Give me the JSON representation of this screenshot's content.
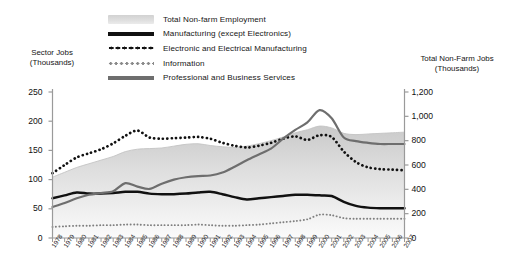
{
  "legend": {
    "items": [
      {
        "label": "Total Non-farm Employment",
        "style": "area-fill",
        "color": "#dcdcdc"
      },
      {
        "label": "Manufacturing (except Electronics)",
        "style": "solid-thick",
        "color": "#111111"
      },
      {
        "label": "Electronic and Electrical Manufacturing",
        "style": "dotted-bold",
        "color": "#111111"
      },
      {
        "label": "Information",
        "style": "dotted-fine",
        "color": "#8a8a8a"
      },
      {
        "label": "Professional and Business Services",
        "style": "solid-medium",
        "color": "#6e6e6e"
      }
    ]
  },
  "axes": {
    "left_title_line1": "Sector Jobs",
    "left_title_line2": "(Thousands)",
    "right_title_line1": "Total Non-Farm Jobs",
    "right_title_line2": "(Thousands)",
    "left_ticks": [
      "250",
      "200",
      "150",
      "100",
      "50",
      "0"
    ],
    "right_ticks": [
      "1,200",
      "1,000",
      "800",
      "600",
      "400",
      "200",
      "0"
    ]
  },
  "chart_data": {
    "type": "line",
    "title": "",
    "xlabel": "",
    "ylabel": "Sector Jobs (Thousands)",
    "y2label": "Total Non-Farm Jobs (Thousands)",
    "ylim": [
      0,
      250
    ],
    "y2lim": [
      0,
      1200
    ],
    "grid": false,
    "legend_position": "top-center",
    "x": [
      "1978",
      "1979",
      "1980",
      "1981",
      "1982",
      "1983",
      "1984",
      "1985",
      "1986",
      "1987",
      "1988",
      "1989",
      "1990",
      "1991",
      "1992",
      "1993",
      "1994",
      "1995",
      "1996",
      "1997",
      "1998",
      "1999",
      "2000",
      "2001",
      "2002",
      "2003",
      "2004",
      "2005",
      "2006",
      "2007"
    ],
    "series": [
      {
        "name": "Total Non-farm Employment",
        "axis": "right",
        "style": "area",
        "values": [
          500,
          540,
          580,
          610,
          640,
          670,
          710,
          730,
          735,
          740,
          755,
          770,
          775,
          760,
          750,
          745,
          755,
          775,
          800,
          830,
          865,
          890,
          920,
          905,
          860,
          850,
          855,
          860,
          865,
          870
        ]
      },
      {
        "name": "Manufacturing (except Electronics)",
        "axis": "left",
        "style": "solid-thick",
        "values": [
          68,
          73,
          78,
          76,
          76,
          77,
          79,
          79,
          76,
          75,
          75,
          76,
          78,
          79,
          75,
          70,
          66,
          68,
          70,
          72,
          74,
          74,
          73,
          72,
          62,
          55,
          52,
          51,
          51,
          51
        ]
      },
      {
        "name": "Electronic and Electrical Manufacturing",
        "axis": "left",
        "style": "dotted-bold",
        "values": [
          111,
          125,
          138,
          145,
          152,
          162,
          175,
          184,
          172,
          170,
          171,
          172,
          173,
          170,
          163,
          158,
          155,
          158,
          163,
          170,
          174,
          168,
          176,
          173,
          148,
          130,
          121,
          118,
          117,
          116
        ]
      },
      {
        "name": "Information",
        "axis": "left",
        "style": "dotted-fine",
        "values": [
          19,
          20,
          21,
          21,
          22,
          22,
          23,
          23,
          22,
          22,
          22,
          22,
          23,
          22,
          21,
          21,
          22,
          23,
          25,
          27,
          29,
          32,
          40,
          39,
          34,
          33,
          33,
          33,
          33,
          33
        ]
      },
      {
        "name": "Professional and Business Services",
        "axis": "left",
        "style": "solid-medium",
        "values": [
          53,
          60,
          68,
          74,
          77,
          80,
          94,
          88,
          84,
          93,
          100,
          104,
          106,
          107,
          112,
          122,
          133,
          143,
          153,
          170,
          185,
          198,
          219,
          205,
          172,
          166,
          163,
          161,
          161,
          161
        ]
      }
    ]
  }
}
